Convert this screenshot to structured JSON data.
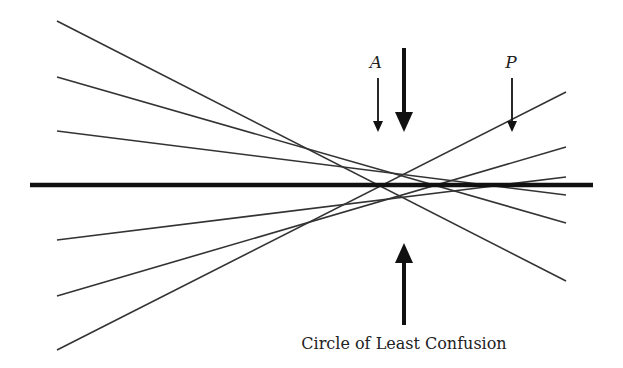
{
  "diagram": {
    "labels": {
      "A": "A",
      "P": "P",
      "caption": "Circle of Least Confusion"
    },
    "colors": {
      "line": "#333333",
      "axis": "#111111",
      "background": "#ffffff"
    },
    "optical_axis": {
      "x1": 30,
      "y1": 185,
      "x2": 593,
      "y2": 185
    },
    "rays": [
      {
        "x1": 57,
        "y1": 21,
        "x2": 566,
        "y2": 281
      },
      {
        "x1": 57,
        "y1": 350,
        "x2": 566,
        "y2": 92
      },
      {
        "x1": 57,
        "y1": 77,
        "x2": 566,
        "y2": 223
      },
      {
        "x1": 57,
        "y1": 296,
        "x2": 566,
        "y2": 147
      },
      {
        "x1": 57,
        "y1": 131,
        "x2": 566,
        "y2": 195
      },
      {
        "x1": 57,
        "y1": 240,
        "x2": 566,
        "y2": 177
      }
    ],
    "arrows": [
      {
        "name": "A",
        "x": 378,
        "y1": 78,
        "y2": 132,
        "weight": "thin"
      },
      {
        "name": "circle-top",
        "x": 404,
        "y1": 48,
        "y2": 132,
        "weight": "bold"
      },
      {
        "name": "P",
        "x": 512,
        "y1": 78,
        "y2": 132,
        "weight": "thin"
      },
      {
        "name": "circle-bottom",
        "x": 404,
        "y1": 325,
        "y2": 243,
        "weight": "bold"
      }
    ]
  }
}
